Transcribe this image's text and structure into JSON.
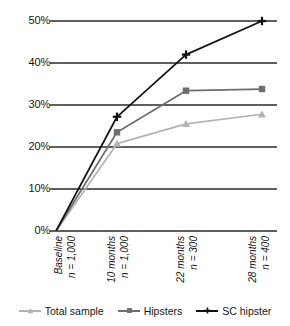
{
  "chart_data": {
    "type": "line",
    "title": "",
    "xlabel": "",
    "ylabel": "",
    "grid": true,
    "legend_position": "bottom",
    "ylim": [
      0,
      50
    ],
    "yticks": [
      0,
      10,
      20,
      30,
      40,
      50
    ],
    "ytick_labels": [
      "0%",
      "10%",
      "20%",
      "30%",
      "40%",
      "50%"
    ],
    "categories": [
      "Baseline",
      "10 months",
      "22 months",
      "28 months"
    ],
    "category_sublabels": [
      "n = 1,000",
      "n = 1,000",
      "n = 300",
      "n = 400"
    ],
    "series": [
      {
        "name": "Total sample",
        "color": "#b3b3b3",
        "marker": "triangle",
        "values": [
          0,
          20.8,
          25.5,
          27.8
        ]
      },
      {
        "name": "Hipsters",
        "color": "#6e6e6e",
        "marker": "square",
        "values": [
          0,
          23.5,
          33.4,
          33.8
        ]
      },
      {
        "name": "SC hipster",
        "color": "#111111",
        "marker": "cross",
        "values": [
          0,
          27.2,
          42.0,
          50.0
        ]
      }
    ]
  },
  "axis": {
    "ytick_labels": [
      "50%",
      "40%",
      "30%",
      "20%",
      "10%",
      "0%"
    ],
    "xticks": [
      {
        "label": "Baseline",
        "sublabel": "n = 1,000"
      },
      {
        "label": "10 months",
        "sublabel": "n = 1,000"
      },
      {
        "label": "22 months",
        "sublabel": "n = 300"
      },
      {
        "label": "28 months",
        "sublabel": "n = 400"
      }
    ]
  },
  "legend": {
    "items": [
      {
        "label": "Total sample",
        "color": "#b3b3b3",
        "marker": "triangle"
      },
      {
        "label": "Hipsters",
        "color": "#6e6e6e",
        "marker": "square"
      },
      {
        "label": "SC hipster",
        "color": "#111111",
        "marker": "cross"
      }
    ]
  },
  "colors": {
    "total_sample": "#b3b3b3",
    "hipsters": "#6e6e6e",
    "sc_hipster": "#111111",
    "grid": "#2a2a2a",
    "background": "#ffffff"
  }
}
